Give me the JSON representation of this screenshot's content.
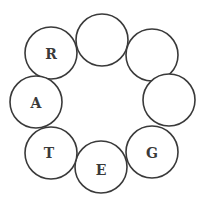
{
  "diagram": {
    "type": "letter-ring-puzzle",
    "radius": 26,
    "circles": [
      {
        "id": "r",
        "cx": 51,
        "cy": 53,
        "letter": "R"
      },
      {
        "id": "top",
        "cx": 102,
        "cy": 40,
        "letter": ""
      },
      {
        "id": "topright",
        "cx": 152,
        "cy": 55,
        "letter": ""
      },
      {
        "id": "right",
        "cx": 169,
        "cy": 100,
        "letter": ""
      },
      {
        "id": "g",
        "cx": 152,
        "cy": 152,
        "letter": "G"
      },
      {
        "id": "e",
        "cx": 101,
        "cy": 167,
        "letter": "E"
      },
      {
        "id": "t",
        "cx": 51,
        "cy": 153,
        "letter": "T"
      },
      {
        "id": "a",
        "cx": 36,
        "cy": 102,
        "letter": "A"
      }
    ]
  }
}
